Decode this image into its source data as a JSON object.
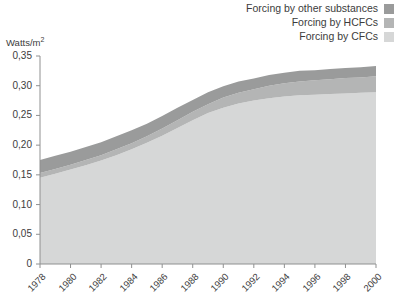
{
  "legend": {
    "position": "top-right",
    "items": [
      {
        "label": "Forcing by other substances",
        "color": "#9a9b9b",
        "key": "other"
      },
      {
        "label": "Forcing by HCFCs",
        "color": "#b4b5b5",
        "key": "hcfc"
      },
      {
        "label": "Forcing by CFCs",
        "color": "#d6d7d7",
        "key": "cfc"
      }
    ]
  },
  "axis": {
    "y_title": "Watts/m",
    "y_title_sup": "2",
    "y_ticks": [
      "0,35",
      "0,30",
      "0,25",
      "0,20",
      "0,15",
      "0,10",
      "0,05",
      "0"
    ],
    "x_ticks": [
      "1978",
      "1980",
      "1982",
      "1984",
      "1986",
      "1988",
      "1990",
      "1992",
      "1994",
      "1996",
      "1998",
      "2000"
    ]
  },
  "chart_data": {
    "type": "area",
    "stacked": true,
    "title": "",
    "xlabel": "",
    "ylabel": "Watts/m2",
    "ylim": [
      0,
      0.35
    ],
    "xlim": [
      1978,
      2000
    ],
    "ytick_values": [
      0.35,
      0.3,
      0.25,
      0.2,
      0.15,
      0.1,
      0.05,
      0
    ],
    "ytick_labels": [
      "0,35",
      "0,30",
      "0,25",
      "0,20",
      "0,15",
      "0,10",
      "0,05",
      "0"
    ],
    "grid": false,
    "decimal_separator": ",",
    "x": [
      1978,
      1979,
      1980,
      1981,
      1982,
      1983,
      1984,
      1985,
      1986,
      1987,
      1988,
      1989,
      1990,
      1991,
      1992,
      1993,
      1994,
      1995,
      1996,
      1997,
      1998,
      1999,
      2000
    ],
    "series": [
      {
        "name": "Forcing by CFCs",
        "color": "#d6d7d7",
        "values": [
          0.145,
          0.152,
          0.159,
          0.166,
          0.174,
          0.183,
          0.193,
          0.204,
          0.216,
          0.229,
          0.242,
          0.254,
          0.263,
          0.27,
          0.275,
          0.279,
          0.282,
          0.284,
          0.285,
          0.286,
          0.287,
          0.288,
          0.289
        ]
      },
      {
        "name": "Forcing by HCFCs",
        "color": "#b4b5b5",
        "values": [
          0.008,
          0.008,
          0.008,
          0.009,
          0.009,
          0.01,
          0.01,
          0.011,
          0.012,
          0.013,
          0.014,
          0.015,
          0.017,
          0.018,
          0.019,
          0.021,
          0.022,
          0.023,
          0.024,
          0.025,
          0.026,
          0.026,
          0.027
        ]
      },
      {
        "name": "Forcing by other substances",
        "color": "#9a9b9b",
        "values": [
          0.022,
          0.022,
          0.022,
          0.022,
          0.022,
          0.022,
          0.022,
          0.021,
          0.021,
          0.021,
          0.02,
          0.02,
          0.019,
          0.019,
          0.018,
          0.018,
          0.018,
          0.018,
          0.017,
          0.017,
          0.017,
          0.017,
          0.017
        ]
      }
    ],
    "totals": [
      0.175,
      0.182,
      0.189,
      0.197,
      0.205,
      0.215,
      0.225,
      0.236,
      0.249,
      0.263,
      0.276,
      0.289,
      0.299,
      0.307,
      0.312,
      0.318,
      0.322,
      0.325,
      0.326,
      0.328,
      0.33,
      0.331,
      0.333
    ]
  }
}
